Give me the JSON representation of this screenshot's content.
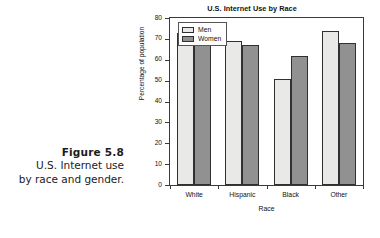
{
  "caption": {
    "figure_number": "Figure 5.8",
    "line1": "U.S. Internet use",
    "line2": "by race and gender."
  },
  "legend": {
    "men_label": "Men",
    "women_label": "Women",
    "men_color": "#e9e9e7",
    "women_color": "#919191"
  },
  "chart_data": {
    "type": "bar",
    "title": "U.S. Internet Use by Race",
    "xlabel": "Race",
    "ylabel": "Percentage of population",
    "categories": [
      "White",
      "Hispanic",
      "Black",
      "Other"
    ],
    "series": [
      {
        "name": "Men",
        "values": [
          73,
          69,
          51,
          74
        ],
        "color": "#e9e9e7"
      },
      {
        "name": "Women",
        "values": [
          68,
          67,
          62,
          68
        ],
        "color": "#919191"
      }
    ],
    "ylim": [
      0,
      80
    ],
    "yticks": [
      0,
      10,
      20,
      30,
      40,
      50,
      60,
      70,
      80
    ],
    "ytick_labels": [
      "0",
      "10",
      "20",
      "30",
      "40",
      "50",
      "60",
      "70",
      "80"
    ],
    "grid": false,
    "legend_position": "top-left-inside"
  }
}
